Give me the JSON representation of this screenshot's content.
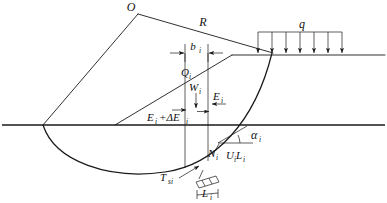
{
  "figure": {
    "type": "slope-stability-slice-diagram",
    "background_color": "#ffffff",
    "line_color": "#1a1a1a",
    "width": 387,
    "height": 203
  },
  "labels": {
    "center_O": "O",
    "radius_R": "R",
    "surcharge_q": "q",
    "slice_width_b": "b",
    "slice_width_b_sub": "i",
    "shear_force_Q": "Q",
    "shear_force_Q_sub": "i",
    "weight_W": "W",
    "weight_W_sub": "i",
    "interslice_E": "E",
    "interslice_E_sub": "i",
    "interslice_sum": "E",
    "interslice_sum_sub": "i",
    "interslice_sum_plus": "+ΔE",
    "interslice_sum_plus_sub": "i",
    "normal_N": "N",
    "normal_N_sub": "i",
    "pore_U": "U",
    "pore_U_sub": "i",
    "pore_L": "L",
    "pore_L_sub": "i",
    "alpha": "α",
    "alpha_sub": "i",
    "tension_T": "T",
    "tension_T_sub": "si",
    "length_L": "L",
    "length_L_sub": "i"
  },
  "geometry": {
    "center": {
      "x": 138,
      "y": 14
    },
    "slip_circle_left_toe": {
      "x": 43,
      "y": 125
    },
    "slip_circle_top_exit": {
      "x": 272,
      "y": 53
    },
    "slope_toe": {
      "x": 115,
      "y": 125
    },
    "slope_crest": {
      "x": 232,
      "y": 55
    },
    "ground_line_y": 125,
    "upper_surface_y": 55,
    "surcharge_box": {
      "x1": 258,
      "x2": 342,
      "top_y": 32
    },
    "surcharge_arrow_count": 7,
    "slice_left_x": 185,
    "slice_right_x": 208
  }
}
